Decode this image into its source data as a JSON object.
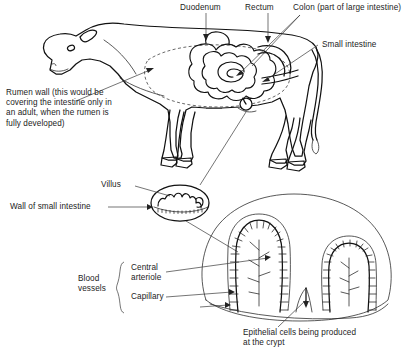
{
  "figure": {
    "background": "#ffffff",
    "ink": "#111111"
  },
  "labels": {
    "duodenum": "Duodenum",
    "rectum": "Rectum",
    "colon": "Colon (part of large intestine)",
    "small_intestine": "Small intestine",
    "rumen_wall": "Rumen wall (this would be\ncovering the intestine only in\nan adult, when the rumen is\nfully developed)",
    "villus": "Villus",
    "wall_of_small_intestine": "Wall of small intestine",
    "blood_vessels": "Blood\nvessels",
    "central_arteriole": "Central\narteriole",
    "capillary": "Capillary",
    "epithelial_cells": "Epithelial cells being produced\nat the crypt"
  },
  "icons": {
    "brace": "curly-brace-icon",
    "arrowhead": "arrowhead-icon"
  }
}
